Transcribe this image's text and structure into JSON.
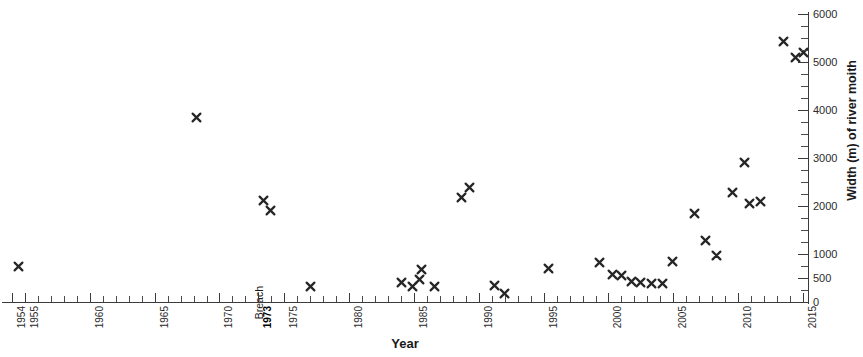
{
  "chart_data": {
    "type": "scatter",
    "title": "",
    "xlabel": "Year",
    "ylabel": "Width (m) of river moith",
    "xlim": [
      1954,
      2015
    ],
    "ylim": [
      0,
      6000
    ],
    "grid": false,
    "legend": null,
    "marker": "x",
    "marker_color": "#262626",
    "x_tick_labels": [
      "1954",
      "1955",
      "1960",
      "1965",
      "1970",
      "1973",
      "1975",
      "1980",
      "1985",
      "1990",
      "1995",
      "2000",
      "2005",
      "2010",
      "2015"
    ],
    "x_tick_values": [
      1954,
      1955,
      1960,
      1965,
      1970,
      1973,
      1975,
      1980,
      1985,
      1990,
      1995,
      2000,
      2005,
      2010,
      2015
    ],
    "x_tick_bold": [
      "1973"
    ],
    "x_minor_tick_interval": 1,
    "y_tick_labels": [
      "0",
      "500",
      "1000",
      "2000",
      "3000",
      "4000",
      "5000",
      "6000"
    ],
    "y_tick_values": [
      0,
      500,
      1000,
      2000,
      3000,
      4000,
      5000,
      6000
    ],
    "y_minor_tick_values": [
      250,
      750,
      1250,
      1500,
      1750,
      2250,
      2500,
      2750,
      3250,
      3500,
      3750,
      4250,
      4500,
      4750,
      5250,
      5500,
      5750
    ],
    "annotations": [
      {
        "text": "Breach",
        "x": 1973,
        "y": 330,
        "rotation": -90
      }
    ],
    "points": [
      {
        "x": 1954.5,
        "y": 740
      },
      {
        "x": 1968.2,
        "y": 3850
      },
      {
        "x": 1973.4,
        "y": 2120
      },
      {
        "x": 1973.9,
        "y": 1910
      },
      {
        "x": 1977.0,
        "y": 330
      },
      {
        "x": 1984.0,
        "y": 400
      },
      {
        "x": 1984.9,
        "y": 330
      },
      {
        "x": 1985.4,
        "y": 470
      },
      {
        "x": 1985.6,
        "y": 680
      },
      {
        "x": 1986.6,
        "y": 330
      },
      {
        "x": 1988.7,
        "y": 2170
      },
      {
        "x": 1989.3,
        "y": 2390
      },
      {
        "x": 1991.2,
        "y": 340
      },
      {
        "x": 1992.0,
        "y": 180
      },
      {
        "x": 1995.4,
        "y": 700
      },
      {
        "x": 1999.3,
        "y": 830
      },
      {
        "x": 2000.3,
        "y": 570
      },
      {
        "x": 2001.0,
        "y": 560
      },
      {
        "x": 2001.8,
        "y": 430
      },
      {
        "x": 2002.5,
        "y": 400
      },
      {
        "x": 2003.3,
        "y": 390
      },
      {
        "x": 2004.2,
        "y": 390
      },
      {
        "x": 2004.9,
        "y": 850
      },
      {
        "x": 2006.6,
        "y": 1850
      },
      {
        "x": 2007.5,
        "y": 1290
      },
      {
        "x": 2008.3,
        "y": 960
      },
      {
        "x": 2009.6,
        "y": 2280
      },
      {
        "x": 2010.5,
        "y": 2900
      },
      {
        "x": 2010.9,
        "y": 2060
      },
      {
        "x": 2011.7,
        "y": 2100
      },
      {
        "x": 2013.5,
        "y": 5430
      },
      {
        "x": 2014.4,
        "y": 5100
      },
      {
        "x": 2015.0,
        "y": 5200
      }
    ]
  }
}
